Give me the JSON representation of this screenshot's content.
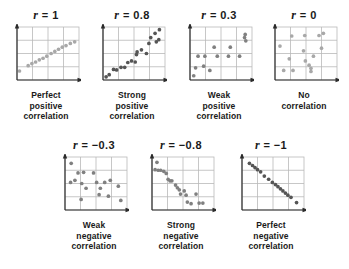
{
  "figure": {
    "dot_color": "#808080",
    "dot_color_light": "#a8a8a8",
    "dot_color_dark": "#555555",
    "grid_color": "#b9b9b9",
    "axis_color": "#2b2b2b",
    "background": "#ffffff",
    "r_symbol": "r",
    "equals": "="
  },
  "chart_data": [
    {
      "type": "scatter",
      "id": "r-1",
      "title": "r = 1",
      "r_value": "1",
      "caption_lines": [
        "Perfect",
        "positive",
        "correlation"
      ],
      "xlabel": "",
      "ylabel": "",
      "xlim": [
        0,
        100
      ],
      "ylim": [
        0,
        100
      ],
      "grid": true,
      "gridlines_x": [
        25,
        50,
        75
      ],
      "gridlines_y": [
        25,
        50,
        75
      ],
      "legend": "none",
      "dot_shade": "light",
      "points": [
        [
          4,
          17
        ],
        [
          18,
          27
        ],
        [
          24,
          31
        ],
        [
          30,
          34
        ],
        [
          36,
          38
        ],
        [
          42,
          41
        ],
        [
          48,
          45
        ],
        [
          55,
          50
        ],
        [
          61,
          54
        ],
        [
          67,
          58
        ],
        [
          73,
          62
        ],
        [
          79,
          65
        ],
        [
          86,
          69
        ],
        [
          93,
          72
        ]
      ]
    },
    {
      "type": "scatter",
      "id": "r-0.8",
      "title": "r = 0.8",
      "r_value": "0.8",
      "caption_lines": [
        "Strong",
        "positive",
        "correlation"
      ],
      "xlabel": "",
      "ylabel": "",
      "xlim": [
        0,
        100
      ],
      "ylim": [
        0,
        100
      ],
      "grid": true,
      "gridlines_x": [
        25,
        50,
        75
      ],
      "gridlines_y": [
        25,
        50,
        75
      ],
      "legend": "none",
      "dot_shade": "dark",
      "points": [
        [
          5,
          6
        ],
        [
          10,
          10
        ],
        [
          17,
          20
        ],
        [
          22,
          19
        ],
        [
          29,
          24
        ],
        [
          35,
          24
        ],
        [
          40,
          33
        ],
        [
          46,
          36
        ],
        [
          52,
          34
        ],
        [
          54,
          48
        ],
        [
          55,
          53
        ],
        [
          62,
          57
        ],
        [
          70,
          50
        ],
        [
          74,
          69
        ],
        [
          77,
          80
        ],
        [
          84,
          88
        ],
        [
          86,
          72
        ],
        [
          90,
          76
        ],
        [
          91,
          95
        ]
      ]
    },
    {
      "type": "scatter",
      "id": "r-0.3",
      "title": "r = 0.3",
      "r_value": "0.3",
      "caption_lines": [
        "Weak",
        "positive",
        "correlation"
      ],
      "xlabel": "",
      "ylabel": "",
      "xlim": [
        0,
        100
      ],
      "ylim": [
        0,
        100
      ],
      "grid": true,
      "gridlines_x": [
        25,
        50,
        75
      ],
      "gridlines_y": [
        25,
        50,
        75
      ],
      "legend": "none",
      "dot_shade": "mid",
      "points": [
        [
          6,
          8
        ],
        [
          9,
          23
        ],
        [
          13,
          45
        ],
        [
          22,
          26
        ],
        [
          24,
          45
        ],
        [
          32,
          18
        ],
        [
          39,
          62
        ],
        [
          44,
          45
        ],
        [
          62,
          45
        ],
        [
          65,
          62
        ],
        [
          80,
          45
        ],
        [
          88,
          80
        ],
        [
          89,
          86
        ],
        [
          90,
          74
        ]
      ]
    },
    {
      "type": "scatter",
      "id": "r-0",
      "title": "r = 0",
      "r_value": "0",
      "caption_lines": [
        "No",
        "correlation"
      ],
      "xlabel": "",
      "ylabel": "",
      "xlim": [
        0,
        100
      ],
      "ylim": [
        0,
        100
      ],
      "grid": true,
      "gridlines_x": [
        25,
        50,
        75
      ],
      "gridlines_y": [
        25,
        50,
        75
      ],
      "legend": "none",
      "dot_shade": "light",
      "points": [
        [
          8,
          64
        ],
        [
          14,
          18
        ],
        [
          23,
          40
        ],
        [
          27,
          83
        ],
        [
          29,
          18
        ],
        [
          46,
          55
        ],
        [
          48,
          84
        ],
        [
          49,
          36
        ],
        [
          55,
          28
        ],
        [
          58,
          16
        ],
        [
          58,
          22
        ],
        [
          62,
          45
        ],
        [
          71,
          84
        ],
        [
          75,
          60
        ],
        [
          78,
          88
        ]
      ]
    },
    {
      "type": "scatter",
      "id": "r--0.3",
      "title": "r = −0.3",
      "r_value": "−0.3",
      "caption_lines": [
        "Weak",
        "negative",
        "correlation"
      ],
      "xlabel": "",
      "ylabel": "",
      "xlim": [
        0,
        100
      ],
      "ylim": [
        0,
        100
      ],
      "grid": true,
      "gridlines_x": [
        25,
        50,
        75
      ],
      "gridlines_y": [
        25,
        50,
        75
      ],
      "legend": "none",
      "dot_shade": "mid",
      "points": [
        [
          10,
          88
        ],
        [
          9,
          52
        ],
        [
          16,
          56
        ],
        [
          21,
          70
        ],
        [
          27,
          50
        ],
        [
          26,
          20
        ],
        [
          30,
          71
        ],
        [
          34,
          41
        ],
        [
          46,
          70
        ],
        [
          51,
          52
        ],
        [
          55,
          29
        ],
        [
          57,
          41
        ],
        [
          64,
          52
        ],
        [
          70,
          26
        ],
        [
          73,
          56
        ],
        [
          86,
          45
        ],
        [
          90,
          18
        ]
      ]
    },
    {
      "type": "scatter",
      "id": "r--0.8",
      "title": "r = −0.8",
      "r_value": "−0.8",
      "caption_lines": [
        "Strong",
        "negative",
        "correlation"
      ],
      "xlabel": "",
      "ylabel": "",
      "xlim": [
        0,
        100
      ],
      "ylim": [
        0,
        100
      ],
      "grid": true,
      "gridlines_x": [
        25,
        50,
        75
      ],
      "gridlines_y": [
        25,
        50,
        75
      ],
      "legend": "none",
      "dot_shade": "mid",
      "points": [
        [
          8,
          90
        ],
        [
          5,
          76
        ],
        [
          10,
          75
        ],
        [
          14,
          75
        ],
        [
          19,
          73
        ],
        [
          23,
          69
        ],
        [
          26,
          58
        ],
        [
          29,
          55
        ],
        [
          32,
          55
        ],
        [
          38,
          47
        ],
        [
          41,
          42
        ],
        [
          44,
          38
        ],
        [
          46,
          30
        ],
        [
          52,
          36
        ],
        [
          55,
          28
        ],
        [
          57,
          15
        ],
        [
          63,
          12
        ],
        [
          71,
          30
        ],
        [
          76,
          13
        ],
        [
          82,
          13
        ]
      ]
    },
    {
      "type": "scatter",
      "id": "r--1",
      "title": "r = −1",
      "r_value": "−1",
      "caption_lines": [
        "Perfect",
        "negative",
        "correlation"
      ],
      "xlabel": "",
      "ylabel": "",
      "xlim": [
        0,
        100
      ],
      "ylim": [
        0,
        100
      ],
      "grid": true,
      "gridlines_x": [
        25,
        50,
        75
      ],
      "gridlines_y": [
        25,
        50,
        75
      ],
      "legend": "none",
      "dot_shade": "dark",
      "points": [
        [
          12,
          88
        ],
        [
          17,
          84
        ],
        [
          21,
          80
        ],
        [
          25,
          76
        ],
        [
          30,
          72
        ],
        [
          36,
          64
        ],
        [
          43,
          58
        ],
        [
          49,
          52
        ],
        [
          54,
          48
        ],
        [
          58,
          44
        ],
        [
          62,
          40
        ],
        [
          66,
          36
        ],
        [
          70,
          32
        ],
        [
          74,
          28
        ],
        [
          79,
          24
        ],
        [
          88,
          14
        ]
      ]
    }
  ],
  "layout": {
    "row1": [
      {
        "id": "r-1",
        "left": 4,
        "top": 8
      },
      {
        "id": "r-0.8",
        "left": 90,
        "top": 8
      },
      {
        "id": "r-0.3",
        "left": 177,
        "top": 8
      },
      {
        "id": "r-0",
        "left": 262,
        "top": 8
      }
    ],
    "row2": [
      {
        "id": "r--0.3",
        "left": 52,
        "top": 138
      },
      {
        "id": "r--0.8",
        "left": 139,
        "top": 138
      },
      {
        "id": "r--1",
        "left": 229,
        "top": 138
      }
    ]
  }
}
